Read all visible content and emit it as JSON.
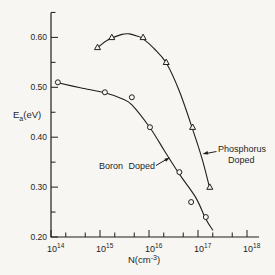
{
  "figure": {
    "background": "#f7f6f3",
    "ink": "#1f1f1f"
  },
  "chart_data": {
    "type": "line",
    "title": "",
    "x_axis": {
      "scale": "log",
      "label_parts": {
        "pre": "N(cm",
        "sup": "-3",
        "post": ")"
      },
      "lim_log10": [
        14,
        18.25
      ],
      "major_ticks": [
        {
          "base": "10",
          "exp": "14"
        },
        {
          "base": "10",
          "exp": "15"
        },
        {
          "base": "10",
          "exp": "16"
        },
        {
          "base": "10",
          "exp": "17"
        },
        {
          "base": "10",
          "exp": "18"
        }
      ],
      "minor_tick_multipliers": [
        2,
        5
      ]
    },
    "y_axis": {
      "label_parts": {
        "pre": "E",
        "sub": "a",
        "post": "(eV)"
      },
      "lim": [
        0.2,
        0.65
      ],
      "major_ticks": [
        {
          "value": 0.6,
          "label": "0.60"
        },
        {
          "value": 0.5,
          "label": "0.50"
        },
        {
          "value": 0.4,
          "label": "0.40"
        },
        {
          "value": 0.3,
          "label": "0.30"
        },
        {
          "value": 0.2,
          "label": "0.20"
        }
      ],
      "minor_values": [
        0.25,
        0.35,
        0.45,
        0.55,
        0.65
      ]
    },
    "series": [
      {
        "name": "Boron Doped",
        "marker": "circle",
        "points_logN_Ea": [
          [
            14.14,
            0.51
          ],
          [
            15.1,
            0.49
          ],
          [
            15.65,
            0.48
          ],
          [
            16.02,
            0.42
          ],
          [
            16.62,
            0.33
          ],
          [
            16.86,
            0.27
          ],
          [
            17.16,
            0.24
          ]
        ],
        "curve_logN_Ea": [
          [
            14.14,
            0.509
          ],
          [
            14.6,
            0.499
          ],
          [
            15.1,
            0.489
          ],
          [
            15.45,
            0.477
          ],
          [
            15.65,
            0.465
          ],
          [
            16.02,
            0.419
          ],
          [
            16.32,
            0.372
          ],
          [
            16.62,
            0.326
          ],
          [
            16.95,
            0.28
          ],
          [
            17.16,
            0.236
          ],
          [
            17.3,
            0.214
          ]
        ]
      },
      {
        "name": "Phosphorus Doped",
        "marker": "triangle",
        "points_logN_Ea": [
          [
            14.95,
            0.58
          ],
          [
            15.24,
            0.6
          ],
          [
            15.88,
            0.6
          ],
          [
            16.35,
            0.55
          ],
          [
            16.89,
            0.42
          ],
          [
            17.24,
            0.3
          ]
        ],
        "curve_logN_Ea": [
          [
            14.95,
            0.579
          ],
          [
            15.14,
            0.594
          ],
          [
            15.45,
            0.606
          ],
          [
            15.6,
            0.607
          ],
          [
            15.75,
            0.603
          ],
          [
            15.88,
            0.597
          ],
          [
            16.1,
            0.578
          ],
          [
            16.35,
            0.549
          ],
          [
            16.62,
            0.492
          ],
          [
            16.89,
            0.416
          ],
          [
            17.08,
            0.358
          ],
          [
            17.24,
            0.297
          ]
        ]
      }
    ],
    "annotations": [
      {
        "id": "boron-label",
        "lines": [
          "Boron Doped"
        ]
      },
      {
        "id": "phosphorus-label",
        "lines": [
          "Phosphorus",
          "Doped"
        ]
      }
    ]
  }
}
